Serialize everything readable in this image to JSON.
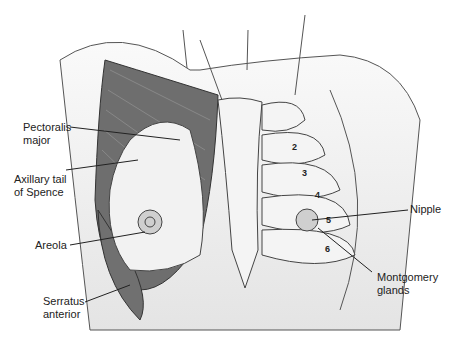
{
  "figure": {
    "labels": {
      "pectoralis_major": [
        "Pectoralis",
        "major"
      ],
      "axillary_tail": [
        "Axillary tail",
        "of Spence"
      ],
      "areola": "Areola",
      "serratus_anterior": [
        "Serratus",
        "anterior"
      ],
      "nipple": "Nipple",
      "montgomery_glands": [
        "Montgomery",
        "glands"
      ]
    },
    "rib_numbers": [
      "2",
      "3",
      "4",
      "5",
      "6"
    ],
    "colors": {
      "muscle": "#6e6e6e",
      "tissue": "#f0f0f0",
      "body": "#e2e2e2",
      "outline": "#444444"
    }
  }
}
